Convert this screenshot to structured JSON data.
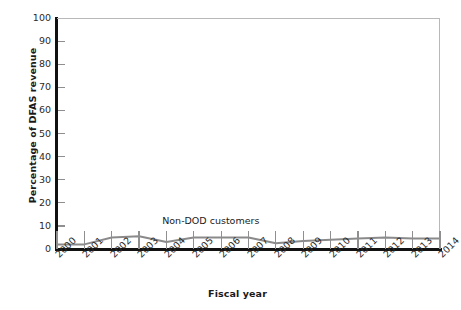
{
  "chart_data": {
    "type": "line",
    "title": "",
    "xlabel": "Fiscal year",
    "ylabel": "Percentage of DFAS revenue",
    "categories": [
      "2000",
      "2001",
      "2002",
      "2003",
      "2004",
      "2005",
      "2006",
      "2007",
      "2008",
      "2009",
      "2010",
      "2011",
      "2012",
      "2013",
      "2014"
    ],
    "x": [
      2000,
      2001,
      2002,
      2003,
      2004,
      2005,
      2006,
      2007,
      2008,
      2009,
      2010,
      2011,
      2012,
      2013,
      2014
    ],
    "series": [
      {
        "name": "Non-DOD customers",
        "values": [
          2,
          2,
          5,
          5.5,
          3,
          5,
          5,
          5,
          2.5,
          3.5,
          4,
          4.5,
          5,
          4.5,
          4.5
        ],
        "color": "#8a8a8a"
      }
    ],
    "ylim": [
      0,
      100
    ],
    "yticks": [
      0,
      10,
      20,
      30,
      40,
      50,
      60,
      70,
      80,
      90,
      100
    ],
    "ytick_labels": [
      "0",
      "10",
      "20",
      "30",
      "40",
      "50",
      "60",
      "70",
      "80",
      "90",
      "100"
    ],
    "grid": false,
    "legend_position": "inline-annotation",
    "annotations": [
      {
        "text": "Non-DOD customers",
        "x": 2005.6,
        "y": 12
      }
    ]
  },
  "axis": {
    "y_title": "Percentage of DFAS revenue",
    "x_title": "Fiscal year"
  },
  "colors": {
    "series_line": "#8a8a8a",
    "axis": "#111111",
    "tick": "#8f8f8f",
    "plot_border": "#b8b8b8",
    "text": "#2b2b2b",
    "background": "#ffffff"
  }
}
